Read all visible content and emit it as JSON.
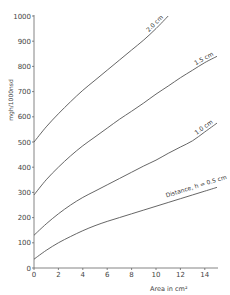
{
  "chart_data": {
    "type": "line",
    "title": "",
    "xlabel": "Area in cm²",
    "ylabel": "mgh/1000nsd",
    "xlim": [
      0,
      15
    ],
    "ylim": [
      0,
      1000
    ],
    "xticks": [
      0,
      2,
      4,
      6,
      8,
      10,
      12,
      14
    ],
    "yticks": [
      0,
      100,
      200,
      300,
      400,
      500,
      600,
      700,
      800,
      900,
      1000
    ],
    "grid": false,
    "legend": "inline labels on curves",
    "series": [
      {
        "name": "2.0 cm",
        "label": "2.0 cm",
        "x": [
          0,
          1,
          2,
          3,
          4,
          5,
          6,
          7,
          8,
          9,
          10,
          11
        ],
        "y": [
          500,
          560,
          612,
          660,
          705,
          745,
          785,
          825,
          865,
          905,
          950,
          1000
        ]
      },
      {
        "name": "1.5 cm",
        "label": "1.5 cm",
        "x": [
          0,
          1,
          2,
          3,
          4,
          5,
          6,
          7,
          8,
          9,
          10,
          11,
          12,
          13,
          14,
          15
        ],
        "y": [
          290,
          350,
          400,
          445,
          485,
          520,
          555,
          590,
          622,
          655,
          690,
          722,
          755,
          785,
          815,
          840
        ]
      },
      {
        "name": "1.0 cm",
        "label": "1.0 cm",
        "x": [
          0,
          1,
          2,
          3,
          4,
          5,
          6,
          7,
          8,
          9,
          10,
          11,
          12,
          13,
          14,
          15
        ],
        "y": [
          130,
          175,
          215,
          250,
          280,
          305,
          330,
          355,
          380,
          405,
          428,
          455,
          480,
          505,
          540,
          575
        ]
      },
      {
        "name": "0.5 cm",
        "label": "Distance, h = 0.5 cm",
        "x": [
          0,
          1,
          2,
          3,
          4,
          5,
          6,
          7,
          8,
          9,
          10,
          11,
          12,
          13,
          14,
          15
        ],
        "y": [
          35,
          70,
          100,
          125,
          148,
          168,
          185,
          200,
          215,
          230,
          245,
          260,
          275,
          290,
          305,
          320
        ]
      }
    ]
  }
}
